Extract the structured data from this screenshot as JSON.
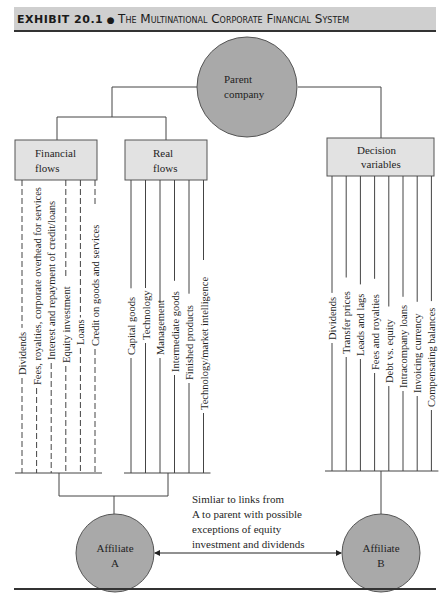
{
  "header": {
    "exhibit_label": "EXHIBIT 20.1",
    "separator": "●",
    "title": "The Multinational Corporate Financial System"
  },
  "nodes": {
    "parent": [
      "Parent",
      "company"
    ],
    "financial_flows": [
      "Financial",
      "flows"
    ],
    "real_flows": [
      "Real",
      "flows"
    ],
    "decision_variables": [
      "Decision",
      "variables"
    ],
    "affiliate_a": [
      "Affiliate",
      "A"
    ],
    "affiliate_b": [
      "Affiliate",
      "B"
    ]
  },
  "financial_flows_items": [
    "Dividends",
    "Fees, royalties, corporate overhead for services",
    "Interest and repayment of credit/loans",
    "Equity investment",
    "Loans",
    "Credit on goods and services"
  ],
  "real_flows_items": [
    "Capital goods",
    "Technology",
    "Management",
    "Intermediate goods",
    "Finished products",
    "Technology/market intelligence"
  ],
  "decision_variables_items": [
    "Dividends",
    "Transfer prices",
    "Leads and lags",
    "Fees and royalties",
    "Debt vs. equity",
    "Intracompany loans",
    "Invoicing currency",
    "Compensating balances"
  ],
  "link_note": [
    "Simliar to links from",
    "A to parent with possible",
    "exceptions of equity",
    "investment and dividends"
  ],
  "colors": {
    "circle_fill": "#a9a9a9",
    "box_fill": "#e2e2e2",
    "line": "#444444",
    "header_bg": "#cfcfcf"
  }
}
